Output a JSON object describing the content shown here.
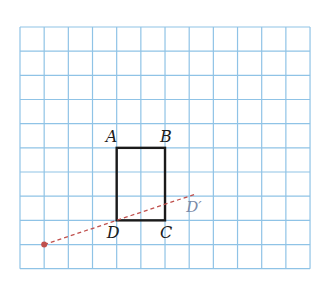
{
  "grid": {
    "x0": 20,
    "y0": 27,
    "cell": 24.17,
    "cols": 12,
    "rows": 10,
    "line_color": "#8fc3e6"
  },
  "figure": {
    "type": "rectangle",
    "vertices": {
      "A": {
        "label": "A",
        "col": 4,
        "row": 5
      },
      "B": {
        "label": "B",
        "col": 6,
        "row": 5
      },
      "C": {
        "label": "C",
        "col": 6,
        "row": 8
      },
      "D": {
        "label": "D",
        "col": 4,
        "row": 8
      }
    },
    "stroke_color": "#1a1a1a"
  },
  "transformation": {
    "center_point": {
      "col": 1,
      "row": 9,
      "color": "#c0504d"
    },
    "image_point": {
      "label": "D′",
      "col": 7,
      "row": 7
    },
    "line_style": "dashed",
    "line_color": "#c0504d"
  },
  "labels": {
    "A": "A",
    "B": "B",
    "C": "C",
    "D": "D",
    "D_prime": "D′"
  }
}
